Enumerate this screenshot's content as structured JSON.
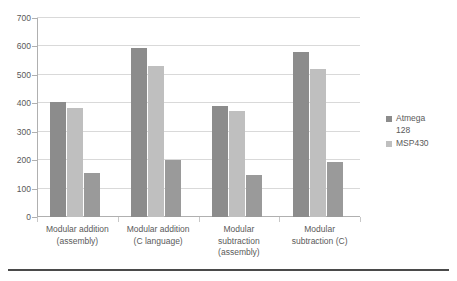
{
  "chart_data": {
    "type": "bar",
    "title": "",
    "subtitle": "",
    "xlabel": "",
    "ylabel": "",
    "ylim": [
      0,
      700
    ],
    "ytick_step": 100,
    "yticks": [
      "0",
      "100",
      "200",
      "300",
      "400",
      "500",
      "600",
      "700"
    ],
    "grid": true,
    "legend_position": "right",
    "categories": [
      "Modular addition\n(assembly)",
      "Modular addition\n(C language)",
      "Modular\nsubtraction\n(assembly)",
      "Modular\nsubtraction (C)"
    ],
    "series": [
      {
        "name": "Atmega\n128",
        "color": "#8c8c8c",
        "values": [
          404,
          595,
          390,
          580
        ]
      },
      {
        "name": "MSP430",
        "color": "#bfbfbf",
        "values": [
          384,
          530,
          374,
          522
        ]
      },
      {
        "name": "",
        "color": "#9a9a9a",
        "values": [
          154,
          200,
          148,
          192
        ]
      }
    ]
  },
  "legend": {
    "entries": [
      {
        "label": "Atmega\n128",
        "color": "#8c8c8c"
      },
      {
        "label": "MSP430",
        "color": "#bfbfbf"
      }
    ]
  },
  "colors": {
    "series_1": "#8c8c8c",
    "series_2": "#bfbfbf",
    "series_3": "#9a9a9a",
    "gridline": "#d9d9d9",
    "axis": "#b0b0b0",
    "text": "#5a5a5a",
    "rule": "#4a4a4a"
  }
}
